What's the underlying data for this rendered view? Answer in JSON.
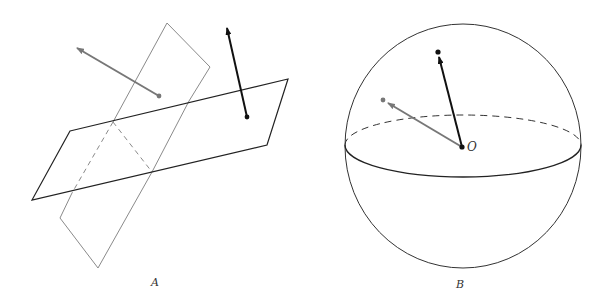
{
  "figure": {
    "panels": [
      {
        "id": "A",
        "label": "A",
        "description": "Two intersecting planes with a gray vector and a black vector"
      },
      {
        "id": "B",
        "label": "B",
        "description": "Sphere with equator and two unit vectors from origin O"
      }
    ],
    "origin_label": "O",
    "colors": {
      "black_vector": "#111111",
      "gray_vector": "#777777",
      "gray_plane": "#8a8a8a",
      "black_plane": "#222222",
      "sphere": "#333333"
    }
  }
}
